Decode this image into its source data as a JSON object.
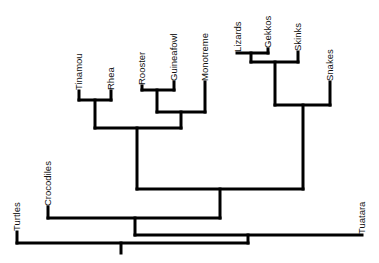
{
  "diagram": {
    "type": "phylogenetic-tree",
    "orientation": "tips-up",
    "line_color": "#000000",
    "background": "#ffffff",
    "taxa": [
      {
        "id": "turtles",
        "label": "Turtles"
      },
      {
        "id": "crocodiles",
        "label": "Crocodiles"
      },
      {
        "id": "tinamou",
        "label": "Tinamou"
      },
      {
        "id": "rhea",
        "label": "Rhea"
      },
      {
        "id": "rooster",
        "label": "Rooster"
      },
      {
        "id": "guineafowl",
        "label": "Guineafowl"
      },
      {
        "id": "monotreme",
        "label": "Monotreme"
      },
      {
        "id": "lizards",
        "label": "Lizards"
      },
      {
        "id": "gekkos",
        "label": "Gekkos"
      },
      {
        "id": "skinks",
        "label": "Skinks"
      },
      {
        "id": "snakes",
        "label": "Snakes"
      },
      {
        "id": "tuatara",
        "label": "Tuatara"
      }
    ],
    "topology": "((Turtles,((Crocodiles,(((Tinamou,Rhea),((Rooster,Guineafowl),Monotreme)),(((Lizards,Gekkos),Skinks),Snakes))),Tuatara)))"
  }
}
